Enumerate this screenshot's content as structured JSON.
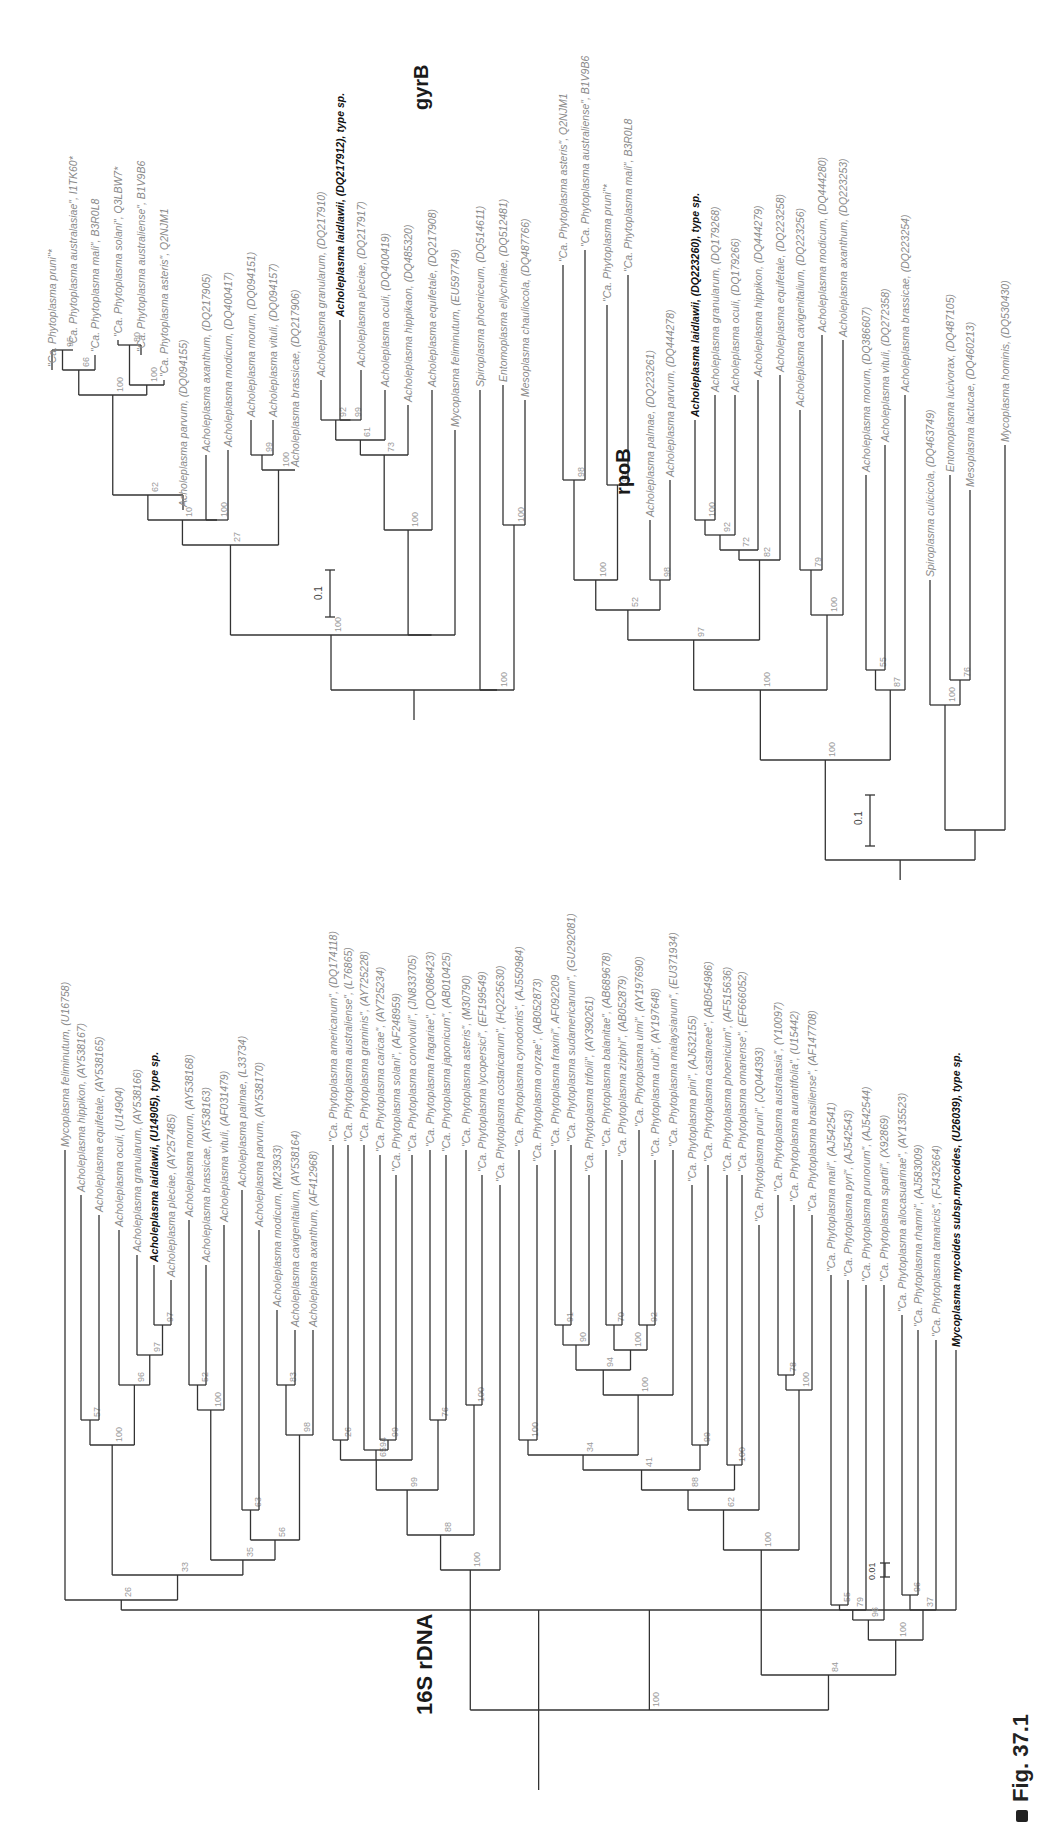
{
  "figure": {
    "caption": "Fig. 37.1",
    "panels": [
      "16S rDNA",
      "gyrB",
      "rpoB"
    ]
  },
  "colors": {
    "branch": "#333333",
    "taxon_text": "#8a8a8a",
    "type_species_text": "#111111",
    "support_text": "#9a9a9a"
  },
  "trees": {
    "rdna16s": {
      "title": "16S rDNA",
      "scale_bar": "0.01",
      "taxa": [
        {
          "label": "Mycoplasma feliminutum, (U16758)"
        },
        {
          "label": "Acholeplasma hippikon, (AY538167)"
        },
        {
          "label": "Acholeplasma equifetale, (AY538165)"
        },
        {
          "label": "Acholeplasma oculi, (U14904)"
        },
        {
          "label": "Acholeplasma granularum, (AY538166)"
        },
        {
          "label": "Acholeplasma laidlawii, (U14905), type sp.",
          "type": true
        },
        {
          "label": "Acholeplasma pleciae, (AY257485)"
        },
        {
          "label": "Acholeplasma morum, (AY538168)"
        },
        {
          "label": "Acholeplasma brassicae, (AY538163)"
        },
        {
          "label": "Acholeplasma vituli, (AF031479)"
        },
        {
          "label": "Acholeplasma palmae, (L33734)"
        },
        {
          "label": "Acholeplasma parvum, (AY538170)"
        },
        {
          "label": "Acholeplasma modicum, (M23933)"
        },
        {
          "label": "Acholeplasma cavigenitalium, (AY538164)"
        },
        {
          "label": "Acholeplasma axanthum, (AF412968)"
        },
        {
          "label": "\"Ca. Phytoplasma americanum\", (DQ174118)"
        },
        {
          "label": "\"Ca. Phytoplasma australiense\", (L76865)"
        },
        {
          "label": "\"Ca. Phytoplasma graminis\", (AY725228)"
        },
        {
          "label": "\"Ca. Phytoplasma caricae\", (AY725234)"
        },
        {
          "label": "\"Ca. Phytoplasma solani\", (AF248959)"
        },
        {
          "label": "\"Ca. Phytoplasma convolvuli\", (JN833705)"
        },
        {
          "label": "\"Ca. Phytoplasma fragariae\", (DQ086423)"
        },
        {
          "label": "\"Ca. Phytoplasma japonicum\", (AB010425)"
        },
        {
          "label": "\"Ca. Phytoplasma asteris\", (M30790)"
        },
        {
          "label": "\"Ca. Phytoplasma lycopersici\", (EF199549)"
        },
        {
          "label": "\"Ca. Phytoplasma costaricanum\", (HQ225630)"
        },
        {
          "label": "\"Ca. Phytoplasma cynodontis\", (AJ550984)"
        },
        {
          "label": "\"Ca. Phytoplasma oryzae\", (AB052873)"
        },
        {
          "label": "\"Ca. Phytoplasma fraxini\", AF092209"
        },
        {
          "label": "\"Ca. Phytoplasma sudamericanum\", (GU292081)"
        },
        {
          "label": "\"Ca. Phytoplasma trifolii\", (AY390261)"
        },
        {
          "label": "\"Ca. Phytoplasma balanitae\", (AB689678)"
        },
        {
          "label": "\"Ca. Phytoplasma ziziphi\", (AB052879)"
        },
        {
          "label": "\"Ca. Phytoplasma ulmi\", (AY197690)"
        },
        {
          "label": "\"Ca. Phytoplasma rubi\", (AY197648)"
        },
        {
          "label": "\"Ca. Phytoplasma malaysianum\", (EU371934)"
        },
        {
          "label": "\"Ca. Phytoplasma pini\", (AJ632155)"
        },
        {
          "label": "\"Ca. Phytoplasma castaneae\", (AB054986)"
        },
        {
          "label": "\"Ca. Phytoplasma phoenicium\", (AF515636)"
        },
        {
          "label": "\"Ca. Phytoplasma omanense\", (EF666052)"
        },
        {
          "label": "\"Ca. Phytoplasma pruni\", (JQ044393)"
        },
        {
          "label": "\"Ca. Phytoplasma australasia\", (Y10097)"
        },
        {
          "label": "\"Ca. Phytoplasma aurantifolia\", (U15442)"
        },
        {
          "label": "\"Ca. Phytoplasma brasiliense\", (AF147708)"
        },
        {
          "label": "\"Ca. Phytoplasma mali\", (AJ542541)"
        },
        {
          "label": "\"Ca. Phytoplasma pyri\", (AJ542543)"
        },
        {
          "label": "\"Ca. Phytoplasma prunorum\", (AJ542544)"
        },
        {
          "label": "\"Ca. Phytoplasma spartii\", (X92869)"
        },
        {
          "label": "\"Ca. Phytoplasma allocasuarinae\", (AY135523)"
        },
        {
          "label": "\"Ca. Phytoplasma rhamni\", (AJ583009)"
        },
        {
          "label": "\"Ca. Phytoplasma tamaricis\", (FJ432664)"
        },
        {
          "label": "Mycoplasma mycoides subsp.mycoides, (U26039), type sp.",
          "type": true
        }
      ],
      "support_values": [
        "26",
        "33",
        "100",
        "57",
        "96",
        "97",
        "97",
        "35",
        "100",
        "52",
        "56",
        "63",
        "98",
        "83",
        "100",
        "100",
        "88",
        "99",
        "65",
        "24",
        "26",
        "94",
        "99",
        "76",
        "100",
        "100",
        "84",
        "100",
        "34",
        "41",
        "100",
        "90",
        "91",
        "94",
        "100",
        "70",
        "92",
        "88",
        "99",
        "62",
        "100",
        "100",
        "78",
        "100",
        "96",
        "79",
        "55",
        "37",
        "96"
      ]
    },
    "gyrB": {
      "title": "gyrB",
      "scale_bar": "0.1",
      "taxa": [
        {
          "label": "\"Ca. Phytoplasma pruni\"*"
        },
        {
          "label": "\"Ca. Phytoplasma australasiae\", I1TK60*"
        },
        {
          "label": "\"Ca. Phytoplasma mali\", B3R0L8"
        },
        {
          "label": "\"Ca. Phytoplasma solani\", Q3LBW7*"
        },
        {
          "label": "\"Ca. Phytoplasma australiense\", B1V9B6"
        },
        {
          "label": "\"Ca. Phytoplasma asteris\", Q2NJM1"
        },
        {
          "label": "Acholeplasma parvum, (DQ094155)"
        },
        {
          "label": "Acholeplasma axanthum, (DQ217905)"
        },
        {
          "label": "Acholeplasma modicum, (DQ400417)"
        },
        {
          "label": "Acholeplasma morum, (DQ094151)"
        },
        {
          "label": "Acholeplasma vituli, (DQ094157)"
        },
        {
          "label": "Acholeplasma brassicae, (DQ217906)"
        },
        {
          "label": "Acholeplasma granularum, (DQ217910)"
        },
        {
          "label": "Acholeplasma laidlawii, (DQ217912), type sp.",
          "type": true
        },
        {
          "label": "Acholeplasma pleciae, (DQ217917)"
        },
        {
          "label": "Acholeplasma oculi, (DQ400419)"
        },
        {
          "label": "Acholeplasma hippikaon, (DQ485320)"
        },
        {
          "label": "Acholeplasma equifetale, (DQ217908)"
        },
        {
          "label": "Mycoplasma feliminutum, (EU597749)"
        },
        {
          "label": "Spiroplasma phoeniceum, (DQ514611)"
        },
        {
          "label": "Entomoplasma ellychniae, (DQ512481)"
        },
        {
          "label": "Mesoplasma chauliocola, (DQ487766)"
        }
      ],
      "support_values": [
        "100",
        "27",
        "10",
        "62",
        "66",
        "95",
        "100",
        "80",
        "100",
        "100",
        "99",
        "100",
        "100",
        "73",
        "61",
        "92",
        "99",
        "100"
      ]
    },
    "rpoB": {
      "title": "rpoB",
      "scale_bar": "0.1",
      "taxa": [
        {
          "label": "\"Ca. Phytoplasma asteris\", Q2NJM1"
        },
        {
          "label": "\"Ca. Phytoplasma australiense\", B1V9B6"
        },
        {
          "label": "\"Ca. Phytoplasma pruni\"*"
        },
        {
          "label": "\"Ca. Phytoplasma mali\", B3R0L8"
        },
        {
          "label": "Acholeplasma palmae, (DQ223261)"
        },
        {
          "label": "Acholeplasma parvum, (DQ444278)"
        },
        {
          "label": "Acholeplasma laidlawii, (DQ223260), type sp.",
          "type": true
        },
        {
          "label": "Acholeplasma granularum, (DQ179268)"
        },
        {
          "label": "Acholeplasma oculi, (DQ179266)"
        },
        {
          "label": "Acholeplasma hippikon, (DQ444279)"
        },
        {
          "label": "Acholeplasma equifetale, (DQ223258)"
        },
        {
          "label": "Acholeplasma cavigenitalium, (DQ223256)"
        },
        {
          "label": "Acholeplasma modicum, (DQ444280)"
        },
        {
          "label": "Acholeplasma axanthum, (DQ223253)"
        },
        {
          "label": "Acholeplasma morum, (DQ386607)"
        },
        {
          "label": "Acholeplasma vituli, (DQ272358)"
        },
        {
          "label": "Acholeplasma brassicae, (DQ223254)"
        },
        {
          "label": "Spiroplasma culicicola, (DQ463749)"
        },
        {
          "label": "Entomoplasma lucivorax, (DQ487105)"
        },
        {
          "label": "Mesoplasma lactucae, (DQ460213)"
        },
        {
          "label": "Mycoplasma hominis, (DQ530430)"
        }
      ],
      "support_values": [
        "100",
        "100",
        "97",
        "52",
        "100",
        "98",
        "92",
        "98",
        "100",
        "92",
        "72",
        "82",
        "100",
        "79",
        "87",
        "55",
        "100",
        "76"
      ]
    }
  }
}
